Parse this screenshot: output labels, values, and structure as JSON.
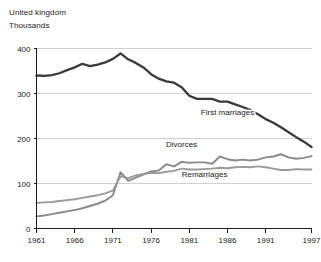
{
  "header": {
    "region": "United kingdom",
    "units": "Thousands"
  },
  "chart_data": {
    "type": "line",
    "title": "",
    "subtitle": "",
    "xlabel": "",
    "ylabel": "Thousands",
    "region": "United kingdom",
    "grid": true,
    "legend_position": "inline-annotations",
    "xlim": [
      1961,
      1997
    ],
    "ylim": [
      0,
      400
    ],
    "yticks": [
      0,
      100,
      200,
      300,
      400
    ],
    "ytick_labels": [
      "0",
      "100",
      "200",
      "300",
      "400"
    ],
    "xticks": [
      1961,
      1966,
      1971,
      1976,
      1981,
      1986,
      1991,
      1997
    ],
    "xtick_labels": [
      "1961",
      "1966",
      "1971",
      "1976",
      "1981",
      "1986",
      "1991",
      "1997"
    ],
    "x": [
      1961,
      1962,
      1963,
      1964,
      1965,
      1966,
      1967,
      1968,
      1969,
      1970,
      1971,
      1972,
      1973,
      1974,
      1975,
      1976,
      1977,
      1978,
      1979,
      1980,
      1981,
      1982,
      1983,
      1984,
      1985,
      1986,
      1987,
      1988,
      1989,
      1990,
      1991,
      1992,
      1993,
      1994,
      1995,
      1996,
      1997
    ],
    "series": [
      {
        "name": "First marriages",
        "color": "#3a3a3a",
        "label_x": 1986,
        "label_y": 252,
        "values": [
          340,
          339,
          341,
          345,
          352,
          358,
          366,
          361,
          364,
          369,
          377,
          389,
          376,
          368,
          358,
          343,
          333,
          327,
          324,
          314,
          295,
          288,
          288,
          288,
          282,
          282,
          276,
          270,
          263,
          254,
          243,
          235,
          225,
          214,
          203,
          193,
          181
        ]
      },
      {
        "name": "Divorces",
        "color": "#8a8a8a",
        "label_x": 1980,
        "label_y": 182,
        "values": [
          27,
          29,
          32,
          35,
          38,
          41,
          45,
          50,
          55,
          62,
          74,
          125,
          106,
          113,
          120,
          127,
          129,
          143,
          138,
          148,
          146,
          147,
          147,
          144,
          160,
          154,
          151,
          153,
          151,
          153,
          158,
          160,
          165,
          158,
          155,
          157,
          161
        ]
      },
      {
        "name": "Remarriages",
        "color": "#9a9a9a",
        "label_x": 1983,
        "label_y": 115,
        "values": [
          57,
          58,
          59,
          61,
          63,
          65,
          68,
          71,
          74,
          78,
          84,
          116,
          112,
          118,
          121,
          124,
          123,
          126,
          128,
          133,
          131,
          131,
          132,
          133,
          135,
          134,
          136,
          137,
          136,
          138,
          136,
          133,
          130,
          130,
          132,
          131,
          131
        ]
      }
    ]
  }
}
